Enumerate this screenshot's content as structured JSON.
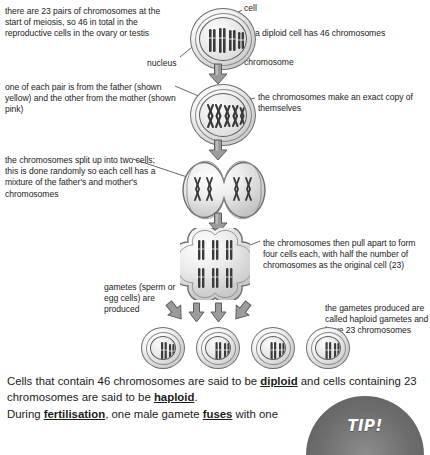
{
  "diagram": {
    "annotations": {
      "left_top": "there are 23 pairs of chromosomes at the start of meiosis, so 46 in total in the reproductive cells in the ovary or testis",
      "left_second": "one of each pair is from the father (shown yellow) and the other from the mother (shown pink)",
      "left_third": "the chromosomes split up into two cells; this is done randomly so each cell has a mixture of the father's and mother's chromosomes",
      "left_fourth": "gametes (sperm or egg cells) are produced",
      "right_first": "a diploid cell has 46 chromosomes",
      "right_second": "the chromosomes make an exact copy of themselves",
      "right_third": "the chromosomes then pull apart to form four cells each, with half the number of chromosomes as the original cell (23)",
      "right_fourth": "the gametes produced are called haploid gametes and have 23 chromosomes"
    },
    "callouts": {
      "cell": "cell",
      "nucleus": "nucleus",
      "chromosome": "chromosome"
    },
    "stages": [
      {
        "name": "diploid-cell",
        "chromosome_count_label": "46"
      },
      {
        "name": "replicated-cell",
        "chromosome_count_label": "46 duplicated"
      },
      {
        "name": "two-cell-stage",
        "chromosome_count_label": "2 cells"
      },
      {
        "name": "four-cell-stage",
        "chromosome_count_label": "4 cells"
      },
      {
        "name": "gametes-row",
        "chromosome_count_label": "4 haploid gametes, 23 chromosomes each"
      }
    ]
  },
  "body": {
    "para1_part1": "Cells that contain 46 chromosomes are said to be ",
    "para1_term1": "diploid",
    "para1_part2": " and cells containing 23 chromosomes are said to be ",
    "para1_term2": "haploid",
    "para1_part3": ".",
    "para2_part1": "During ",
    "para2_term1": "fertilisation",
    "para2_part2": ", one male gamete ",
    "para2_term2": "fuses",
    "para2_part3": " with one"
  },
  "tip": {
    "label": "TIP!"
  },
  "colors": {
    "page_background": "#ffffff",
    "text": "#232323",
    "body_text": "#1b1b1b",
    "cell_outline": "#6e6e6e",
    "chromosome": "#3a3a3a",
    "arrow_fill": "#8f8f8f",
    "arrow_outline": "#5d5d5d",
    "tip_background": "#6d6d6d",
    "tip_text": "#ffffff"
  }
}
